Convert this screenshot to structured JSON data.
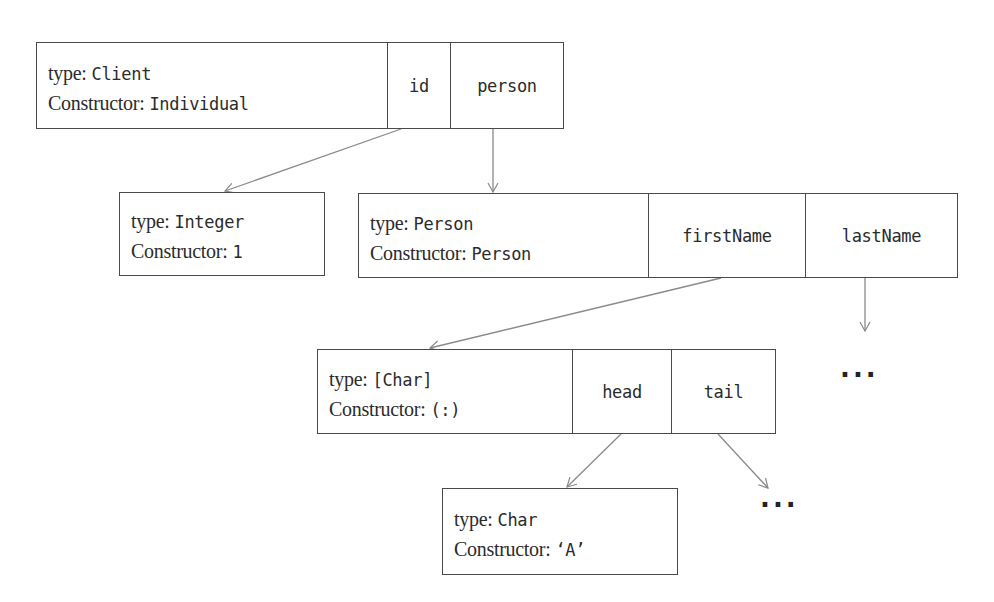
{
  "diagram": {
    "type_label": "type:",
    "constructor_label": "Constructor:",
    "nodes": {
      "client": {
        "type": "Client",
        "constructor": "Individual",
        "fields": [
          "id",
          "person"
        ]
      },
      "integer": {
        "type": "Integer",
        "constructor": "1",
        "fields": []
      },
      "person": {
        "type": "Person",
        "constructor": "Person",
        "fields": [
          "firstName",
          "lastName"
        ]
      },
      "charlist": {
        "type": "[Char]",
        "constructor": "(:)",
        "fields": [
          "head",
          "tail"
        ]
      },
      "char": {
        "type": "Char",
        "constructor": "‘A’",
        "fields": []
      }
    },
    "ellipsis": {
      "lastName_target": "...",
      "tail_target": "..."
    },
    "edges": [
      {
        "from": "client.id",
        "to": "integer"
      },
      {
        "from": "client.person",
        "to": "person"
      },
      {
        "from": "person.firstName",
        "to": "charlist"
      },
      {
        "from": "person.lastName",
        "to": "ellipsis.lastName_target"
      },
      {
        "from": "charlist.head",
        "to": "char"
      },
      {
        "from": "charlist.tail",
        "to": "ellipsis.tail_target"
      }
    ],
    "colors": {
      "line": "#4a4a4a",
      "arrow": "#8a8a8a",
      "text": "#2b2b2b",
      "background": "#ffffff"
    }
  }
}
